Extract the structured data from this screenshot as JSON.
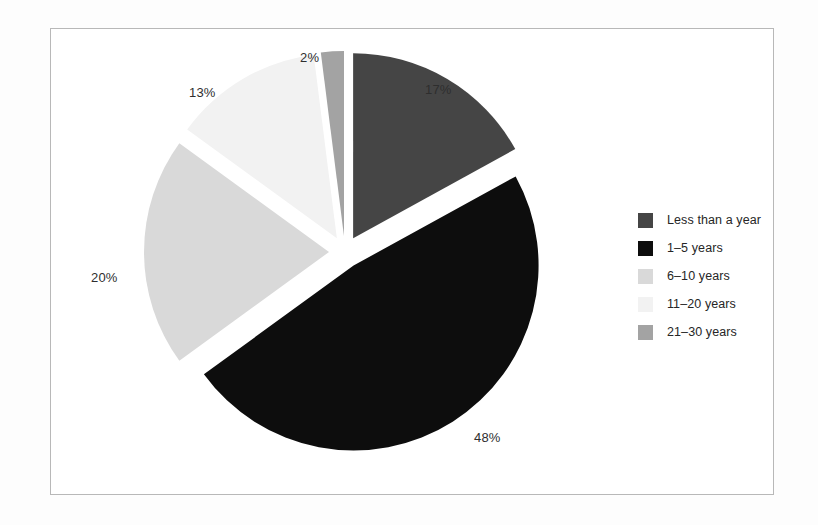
{
  "figure": {
    "background_color": "#fdfdfd",
    "frame_border_color": "#b8b8b8",
    "label_text_color": "#2e2e2e",
    "legend_text_color": "#262626"
  },
  "chart_data": {
    "type": "pie",
    "title": "",
    "subtitle": "",
    "xlabel": "",
    "ylabel": "",
    "grid": false,
    "legend_position": "right",
    "exploded": true,
    "start_angle_deg": 0,
    "direction": "clockwise",
    "units": "percent",
    "categories": [
      "Less than a year",
      "1–5 years",
      "6–10 years",
      "11–20 years",
      "21–30 years"
    ],
    "values": [
      17,
      48,
      20,
      13,
      2
    ],
    "data_labels": [
      "17%",
      "48%",
      "20%",
      "13%",
      "2%"
    ],
    "colors": [
      "#454545",
      "#0d0d0d",
      "#d9d9d9",
      "#f2f2f2",
      "#a3a3a3"
    ],
    "slices": [
      {
        "label": "Less than a year",
        "value": 17,
        "data_label": "17%",
        "color": "#454545",
        "label_x": 425,
        "label_y": 82
      },
      {
        "label": "1–5 years",
        "value": 48,
        "data_label": "48%",
        "color": "#0d0d0d",
        "label_x": 474,
        "label_y": 430
      },
      {
        "label": "6–10 years",
        "value": 20,
        "data_label": "20%",
        "color": "#d9d9d9",
        "label_x": 91,
        "label_y": 270
      },
      {
        "label": "11–20 years",
        "value": 13,
        "data_label": "13%",
        "color": "#f2f2f2",
        "label_x": 189,
        "label_y": 85
      },
      {
        "label": "21–30 years",
        "value": 2,
        "data_label": "2%",
        "color": "#a3a3a3",
        "label_x": 300,
        "label_y": 50
      }
    ]
  },
  "legend": {
    "items": [
      {
        "label": "Less than a year",
        "color": "#454545"
      },
      {
        "label": "1–5 years",
        "color": "#0d0d0d"
      },
      {
        "label": "6–10 years",
        "color": "#d9d9d9"
      },
      {
        "label": "11–20 years",
        "color": "#f2f2f2"
      },
      {
        "label": "21–30 years",
        "color": "#a3a3a3"
      }
    ]
  }
}
